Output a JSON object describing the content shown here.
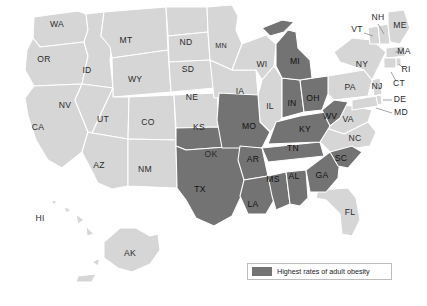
{
  "figure": {
    "type": "choropleth-map",
    "region": "United States"
  },
  "legend": {
    "label": "Highest rates of adult obesity",
    "swatch_color": "#737373"
  },
  "colors": {
    "highlight": "#737373",
    "base": "#d6d6d6",
    "border": "#ffffff",
    "background": "#ffffff",
    "label_text": "#2b2b2b"
  },
  "chart_data": {
    "type": "heatmap",
    "title": "Highest rates of adult obesity",
    "xlabel": "",
    "ylabel": "",
    "legend_position": "bottom-right",
    "grid": false,
    "categories": [
      "AL",
      "AK",
      "AZ",
      "AR",
      "CA",
      "CO",
      "CT",
      "DE",
      "FL",
      "GA",
      "HI",
      "ID",
      "IL",
      "IN",
      "IA",
      "KS",
      "KY",
      "LA",
      "ME",
      "MD",
      "MA",
      "MI",
      "MN",
      "MS",
      "MO",
      "MT",
      "NE",
      "NV",
      "NH",
      "NJ",
      "NM",
      "NY",
      "NC",
      "ND",
      "OH",
      "OK",
      "OR",
      "PA",
      "RI",
      "SC",
      "SD",
      "TN",
      "TX",
      "UT",
      "VT",
      "VA",
      "WA",
      "WV",
      "WI",
      "WY"
    ],
    "values": [
      1,
      0,
      0,
      1,
      0,
      0,
      0,
      0,
      0,
      1,
      0,
      0,
      0,
      1,
      0,
      0,
      1,
      1,
      0,
      0,
      0,
      1,
      0,
      1,
      1,
      0,
      0,
      0,
      0,
      0,
      0,
      0,
      0,
      0,
      1,
      1,
      0,
      0,
      0,
      1,
      0,
      1,
      1,
      0,
      0,
      0,
      0,
      1,
      0,
      0
    ],
    "value_meaning": {
      "1": "Highest rates of adult obesity",
      "0": "Not among highest rates"
    },
    "highlighted_states": [
      "AL",
      "AR",
      "GA",
      "IN",
      "KY",
      "LA",
      "MI",
      "MS",
      "MO",
      "OH",
      "OK",
      "SC",
      "TN",
      "TX",
      "WV"
    ],
    "highlighted_count": 15
  },
  "map": {
    "labels": [
      {
        "id": "WA",
        "text": "WA",
        "x": 57,
        "y": 25,
        "size": "normal",
        "dark": false
      },
      {
        "id": "OR",
        "text": "OR",
        "x": 44,
        "y": 60,
        "size": "normal",
        "dark": false
      },
      {
        "id": "CA",
        "text": "CA",
        "x": 38,
        "y": 128,
        "size": "normal",
        "dark": false
      },
      {
        "id": "ID",
        "text": "ID",
        "x": 87,
        "y": 71,
        "size": "normal",
        "dark": false
      },
      {
        "id": "NV",
        "text": "NV",
        "x": 65,
        "y": 106,
        "size": "normal",
        "dark": false
      },
      {
        "id": "MT",
        "text": "MT",
        "x": 126,
        "y": 41,
        "size": "normal",
        "dark": false
      },
      {
        "id": "WY",
        "text": "WY",
        "x": 135,
        "y": 80,
        "size": "normal",
        "dark": false
      },
      {
        "id": "UT",
        "text": "UT",
        "x": 103,
        "y": 120,
        "size": "normal",
        "dark": false
      },
      {
        "id": "CO",
        "text": "CO",
        "x": 148,
        "y": 123,
        "size": "normal",
        "dark": false
      },
      {
        "id": "AZ",
        "text": "AZ",
        "x": 99,
        "y": 166,
        "size": "normal",
        "dark": false
      },
      {
        "id": "NM",
        "text": "NM",
        "x": 145,
        "y": 170,
        "size": "normal",
        "dark": false
      },
      {
        "id": "ND",
        "text": "ND",
        "x": 186,
        "y": 43,
        "size": "normal",
        "dark": false
      },
      {
        "id": "SD",
        "text": "SD",
        "x": 188,
        "y": 70,
        "size": "normal",
        "dark": false
      },
      {
        "id": "NE",
        "text": "NE",
        "x": 192,
        "y": 98,
        "size": "normal",
        "dark": false
      },
      {
        "id": "KS",
        "text": "KS",
        "x": 199,
        "y": 128,
        "size": "normal",
        "dark": false
      },
      {
        "id": "OK",
        "text": "OK",
        "x": 211,
        "y": 155,
        "size": "normal",
        "dark": false
      },
      {
        "id": "TX",
        "text": "TX",
        "x": 200,
        "y": 190,
        "size": "normal",
        "dark": true
      },
      {
        "id": "MN",
        "text": "MN",
        "x": 221,
        "y": 46,
        "size": "small",
        "dark": false
      },
      {
        "id": "IA",
        "text": "IA",
        "x": 240,
        "y": 92,
        "size": "normal",
        "dark": false
      },
      {
        "id": "WI",
        "text": "WI",
        "x": 262,
        "y": 65,
        "size": "normal",
        "dark": false
      },
      {
        "id": "IL",
        "text": "IL",
        "x": 270,
        "y": 107,
        "size": "normal",
        "dark": false
      },
      {
        "id": "MO",
        "text": "MO",
        "x": 249,
        "y": 127,
        "size": "normal",
        "dark": true
      },
      {
        "id": "AR",
        "text": "AR",
        "x": 253,
        "y": 160,
        "size": "normal",
        "dark": true
      },
      {
        "id": "LA",
        "text": "LA",
        "x": 253,
        "y": 205,
        "size": "normal",
        "dark": true
      },
      {
        "id": "MS",
        "text": "MS",
        "x": 273,
        "y": 180,
        "size": "normal",
        "dark": true
      },
      {
        "id": "AL",
        "text": "AL",
        "x": 294,
        "y": 177,
        "size": "normal",
        "dark": true
      },
      {
        "id": "TN",
        "text": "TN",
        "x": 293,
        "y": 149,
        "size": "normal",
        "dark": true
      },
      {
        "id": "KY",
        "text": "KY",
        "x": 305,
        "y": 130,
        "size": "normal",
        "dark": true
      },
      {
        "id": "IN",
        "text": "IN",
        "x": 292,
        "y": 104,
        "size": "normal",
        "dark": true
      },
      {
        "id": "OH",
        "text": "OH",
        "x": 313,
        "y": 99,
        "size": "normal",
        "dark": true
      },
      {
        "id": "MI",
        "text": "MI",
        "x": 295,
        "y": 62,
        "size": "normal",
        "dark": true
      },
      {
        "id": "WV",
        "text": "WV",
        "x": 330,
        "y": 117,
        "size": "normal",
        "dark": true
      },
      {
        "id": "GA",
        "text": "GA",
        "x": 322,
        "y": 176,
        "size": "normal",
        "dark": true
      },
      {
        "id": "SC",
        "text": "SC",
        "x": 341,
        "y": 159,
        "size": "normal",
        "dark": true
      },
      {
        "id": "NC",
        "text": "NC",
        "x": 355,
        "y": 139,
        "size": "normal",
        "dark": false
      },
      {
        "id": "VA",
        "text": "VA",
        "x": 348,
        "y": 120,
        "size": "normal",
        "dark": false
      },
      {
        "id": "FL",
        "text": "FL",
        "x": 350,
        "y": 213,
        "size": "normal",
        "dark": false
      },
      {
        "id": "PA",
        "text": "PA",
        "x": 350,
        "y": 88,
        "size": "normal",
        "dark": false
      },
      {
        "id": "NY",
        "text": "NY",
        "x": 362,
        "y": 65,
        "size": "normal",
        "dark": false
      },
      {
        "id": "VT",
        "text": "VT",
        "x": 357,
        "y": 30,
        "size": "normal",
        "dark": false
      },
      {
        "id": "NH",
        "text": "NH",
        "x": 378,
        "y": 18,
        "size": "normal",
        "dark": false
      },
      {
        "id": "ME",
        "text": "ME",
        "x": 400,
        "y": 26,
        "size": "normal",
        "dark": false
      },
      {
        "id": "MA",
        "text": "MA",
        "x": 404,
        "y": 52,
        "size": "normal",
        "dark": false
      },
      {
        "id": "RI",
        "text": "RI",
        "x": 406,
        "y": 70,
        "size": "normal",
        "dark": false
      },
      {
        "id": "CT",
        "text": "CT",
        "x": 399,
        "y": 84,
        "size": "normal",
        "dark": false
      },
      {
        "id": "NJ",
        "text": "NJ",
        "x": 377,
        "y": 87,
        "size": "normal",
        "dark": false
      },
      {
        "id": "DE",
        "text": "DE",
        "x": 400,
        "y": 100,
        "size": "normal",
        "dark": false
      },
      {
        "id": "MD",
        "text": "MD",
        "x": 401,
        "y": 113,
        "size": "normal",
        "dark": false
      },
      {
        "id": "HI",
        "text": "HI",
        "x": 40,
        "y": 219,
        "size": "normal",
        "dark": false
      },
      {
        "id": "AK",
        "text": "AK",
        "x": 130,
        "y": 254,
        "size": "normal",
        "dark": false
      }
    ]
  }
}
